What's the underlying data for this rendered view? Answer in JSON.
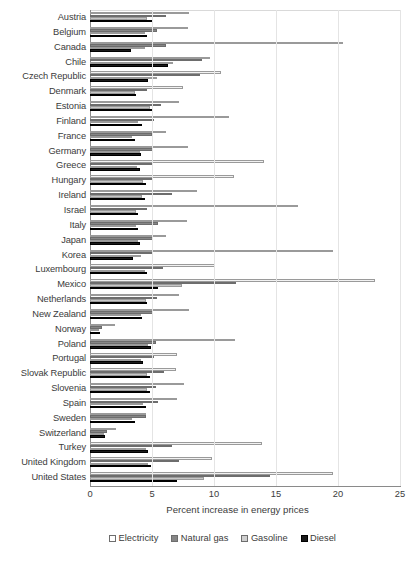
{
  "chart_data": {
    "type": "bar",
    "orientation": "horizontal",
    "title": "",
    "xlabel": "Percent increase in energy prices",
    "ylabel": "",
    "xlim": [
      0,
      25
    ],
    "xticks": [
      0,
      5,
      10,
      15,
      20,
      25
    ],
    "grid": true,
    "legend_position": "bottom",
    "categories": [
      "Austria",
      "Belgium",
      "Canada",
      "Chile",
      "Czech Republic",
      "Denmark",
      "Estonia",
      "Finland",
      "France",
      "Germany",
      "Greece",
      "Hungary",
      "Ireland",
      "Israel",
      "Italy",
      "Japan",
      "Korea",
      "Luxembourg",
      "Mexico",
      "Netherlands",
      "New Zealand",
      "Norway",
      "Poland",
      "Portugal",
      "Slovak Republic",
      "Slovenia",
      "Spain",
      "Sweden",
      "Switzerland",
      "Turkey",
      "United Kingdom",
      "United States"
    ],
    "series": [
      {
        "name": "Electricity",
        "color": "#f2f2f2",
        "values": [
          8.0,
          7.9,
          20.4,
          9.7,
          10.6,
          7.5,
          7.2,
          11.2,
          6.1,
          7.9,
          14.0,
          11.6,
          8.6,
          16.8,
          7.8,
          6.1,
          19.6,
          10.1,
          23.0,
          7.2,
          8.0,
          2.0,
          11.7,
          7.0,
          6.9,
          7.6,
          7.0,
          4.5,
          2.1,
          13.9,
          9.8,
          19.6
        ]
      },
      {
        "name": "Natural gas",
        "color": "#868686",
        "values": [
          6.1,
          5.4,
          6.1,
          9.0,
          8.9,
          4.6,
          5.7,
          5.2,
          5.0,
          5.1,
          5.0,
          5.0,
          6.6,
          4.6,
          5.5,
          5.1,
          5.1,
          5.9,
          11.8,
          5.4,
          5.1,
          1.0,
          5.3,
          5.2,
          6.0,
          5.3,
          5.5,
          4.5,
          1.4,
          6.6,
          7.2,
          14.5
        ]
      },
      {
        "name": "Gasoline",
        "color": "#c6c6c6",
        "values": [
          4.6,
          4.4,
          4.4,
          6.7,
          5.4,
          3.6,
          4.8,
          3.9,
          3.4,
          4.0,
          3.8,
          4.3,
          4.2,
          3.7,
          3.7,
          3.9,
          4.1,
          4.4,
          7.4,
          4.5,
          4.1,
          0.7,
          4.7,
          4.1,
          4.6,
          4.6,
          4.3,
          3.4,
          1.1,
          4.5,
          4.7,
          9.2
        ]
      },
      {
        "name": "Diesel",
        "color": "#1a1a1a",
        "values": [
          5.0,
          4.6,
          3.3,
          6.3,
          4.7,
          3.7,
          5.1,
          4.2,
          3.6,
          4.1,
          4.0,
          4.5,
          4.4,
          3.9,
          3.9,
          4.0,
          3.5,
          4.6,
          5.5,
          4.6,
          4.2,
          0.8,
          4.9,
          4.3,
          4.8,
          4.8,
          4.5,
          3.6,
          1.2,
          4.7,
          4.9,
          7.0
        ]
      }
    ]
  },
  "legend": {
    "items": [
      {
        "label": "Electricity",
        "key": "electricity"
      },
      {
        "label": "Natural gas",
        "key": "gas"
      },
      {
        "label": "Gasoline",
        "key": "gasoline"
      },
      {
        "label": "Diesel",
        "key": "diesel"
      }
    ]
  },
  "caption": {
    "text": ""
  }
}
